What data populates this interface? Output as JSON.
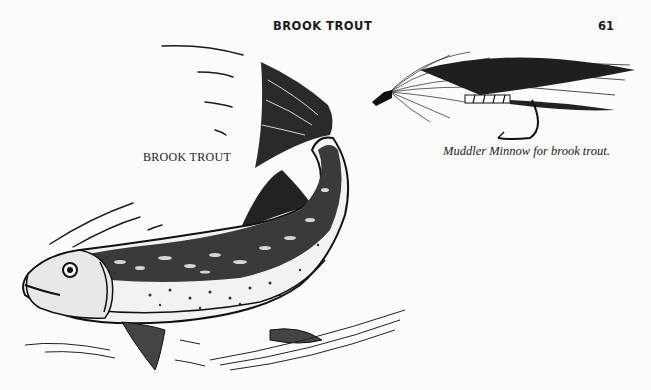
{
  "header": {
    "running_title": "BROOK TROUT",
    "page_number": "61"
  },
  "figures": [
    {
      "id": "fish",
      "label": "BROOK TROUT",
      "icon": "brook-trout-illustration"
    },
    {
      "id": "fly",
      "caption": "Muddler Minnow for brook trout.",
      "icon": "muddler-minnow-fly-illustration"
    }
  ],
  "colors": {
    "paper": "#fbfbfb",
    "ink": "#1a1a1a"
  }
}
